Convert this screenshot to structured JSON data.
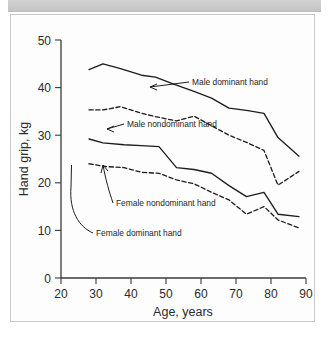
{
  "figure": {
    "background_color": "#fdfdfd",
    "header_color": "#cccccc",
    "line_color": "#1d1d1d"
  },
  "chart_data": {
    "type": "line",
    "title": "",
    "xlabel": "Age, years",
    "ylabel": "Hand grip, kg",
    "xlim": [
      20,
      90
    ],
    "ylim": [
      0,
      50
    ],
    "xticks": [
      "20",
      "30",
      "40",
      "50",
      "60",
      "70",
      "80",
      "90"
    ],
    "yticks": [
      "0",
      "10",
      "20",
      "30",
      "40",
      "50"
    ],
    "grid": false,
    "legend": "inline-annotations",
    "series": [
      {
        "name": "Male dominant hand",
        "style": "solid",
        "x": [
          28,
          32,
          37,
          43,
          47,
          52,
          58,
          63,
          68,
          73,
          78,
          82,
          88
        ],
        "values": [
          43.8,
          45.0,
          44.0,
          42.6,
          42.2,
          40.8,
          39.2,
          37.8,
          35.7,
          35.2,
          34.6,
          29.5,
          25.6
        ]
      },
      {
        "name": "Male nondominant hand",
        "style": "dashed",
        "x": [
          28,
          32,
          37,
          43,
          47,
          53,
          58,
          63,
          68,
          73,
          78,
          82,
          88
        ],
        "values": [
          35.3,
          35.3,
          36.0,
          34.6,
          33.9,
          33.0,
          34.0,
          32.0,
          30.0,
          28.5,
          26.8,
          19.5,
          22.4
        ]
      },
      {
        "name": "Female dominant hand",
        "style": "solid",
        "x": [
          28,
          32,
          38,
          43,
          48,
          53,
          58,
          63,
          68,
          73,
          78,
          82,
          88
        ],
        "values": [
          29.2,
          28.4,
          28.0,
          27.8,
          27.6,
          23.2,
          22.8,
          22.0,
          19.4,
          17.1,
          18.0,
          13.4,
          12.9
        ]
      },
      {
        "name": "Female nondominant hand",
        "style": "dashed",
        "x": [
          28,
          33,
          38,
          43,
          48,
          53,
          58,
          63,
          68,
          73,
          78,
          82,
          88
        ],
        "values": [
          24.0,
          23.4,
          23.2,
          22.2,
          22.0,
          20.6,
          19.8,
          18.0,
          16.4,
          13.4,
          15.0,
          12.2,
          10.5
        ]
      }
    ],
    "annotations": [
      {
        "text": "Male dominant hand",
        "series": "Male dominant hand"
      },
      {
        "text": "Male nondominant hand",
        "series": "Male nondominant hand"
      },
      {
        "text": "Female nondominant hand",
        "series": "Female nondominant hand"
      },
      {
        "text": "Female dominant hand",
        "series": "Female dominant hand"
      }
    ]
  }
}
